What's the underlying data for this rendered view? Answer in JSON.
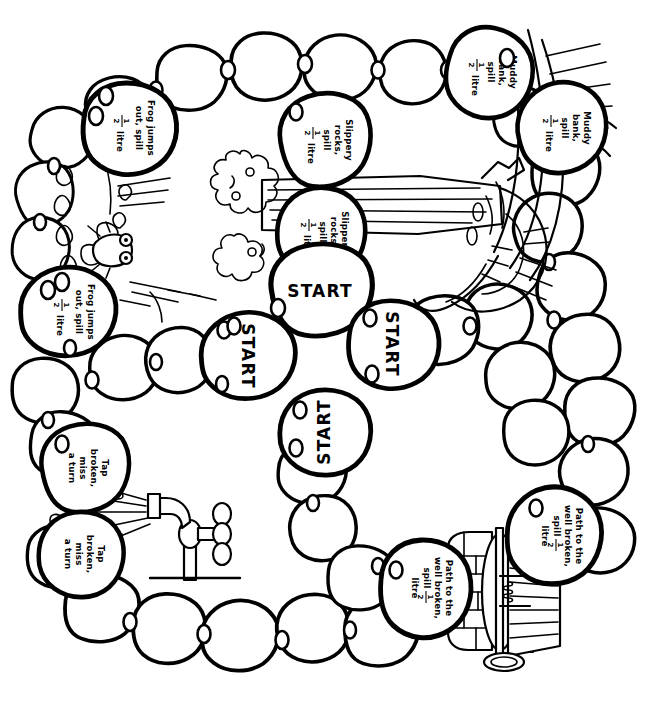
{
  "page": {
    "width": 661,
    "height": 727,
    "ink_color": "#000000",
    "paper_color": "#ffffff"
  },
  "hazards": {
    "frog": {
      "line1": "Frog jumps",
      "line2": "out, spill",
      "fraction_numerator": "1",
      "fraction_denominator": "2",
      "unit": "litre",
      "full_text": "Frog jumps out, spill 1/2 litre"
    },
    "slippery": {
      "line1": "Slippery",
      "line2": "rocks,",
      "line3": "spill",
      "fraction_numerator": "1",
      "fraction_denominator": "2",
      "unit": "litre",
      "full_text": "Slippery rocks, spill 1/2 litre"
    },
    "muddy": {
      "line1": "Muddy",
      "line2": "bank,",
      "line3": "spill",
      "fraction_numerator": "1",
      "fraction_denominator": "2",
      "unit": "litre",
      "full_text": "Muddy bank, spill 1/2 litre"
    },
    "tap": {
      "line1": "Tap",
      "line2": "broken,",
      "line3": "miss",
      "line4": "a turn",
      "full_text": "Tap broken, miss a turn"
    },
    "well": {
      "line1": "Path to the",
      "line2": "well broken,",
      "line3": "spill",
      "fraction_numerator": "1",
      "fraction_denominator": "2",
      "unit": "litre",
      "full_text": "Path to the well broken, spill 1/2 litre"
    }
  },
  "start_stones": [
    {
      "id": "start-top",
      "label": "START",
      "rotation": 0
    },
    {
      "id": "start-left",
      "label": "START",
      "rotation": 90
    },
    {
      "id": "start-right",
      "label": "START",
      "rotation": 90
    },
    {
      "id": "start-bottom",
      "label": "START",
      "rotation": 180
    }
  ],
  "hazard_stones": [
    {
      "id": "hazard-frog-upper",
      "hazard": "frog",
      "rotation": 90
    },
    {
      "id": "hazard-frog-lower",
      "hazard": "frog",
      "rotation": 90
    },
    {
      "id": "hazard-slippery-upper",
      "hazard": "slippery",
      "rotation": 90
    },
    {
      "id": "hazard-slippery-lower",
      "hazard": "slippery",
      "rotation": 90
    },
    {
      "id": "hazard-muddy-upper",
      "hazard": "muddy",
      "rotation": 90
    },
    {
      "id": "hazard-muddy-lower",
      "hazard": "muddy",
      "rotation": 90
    },
    {
      "id": "hazard-tap-upper",
      "hazard": "tap",
      "rotation": 90
    },
    {
      "id": "hazard-tap-lower",
      "hazard": "tap",
      "rotation": 90
    },
    {
      "id": "hazard-well-left",
      "hazard": "well",
      "rotation": 90
    },
    {
      "id": "hazard-well-right",
      "hazard": "well",
      "rotation": 90
    }
  ],
  "illustrations": [
    {
      "id": "fallen-log",
      "name": "fallen log bridge with branch and foliage"
    },
    {
      "id": "tree",
      "name": "large tree trunk with roots at right"
    },
    {
      "id": "frog-pond",
      "name": "frog jumping out of water at left"
    },
    {
      "id": "standpipe-tap",
      "name": "broken standpipe tap spraying water"
    },
    {
      "id": "stone-well",
      "name": "stone well with roof and winch"
    }
  ]
}
